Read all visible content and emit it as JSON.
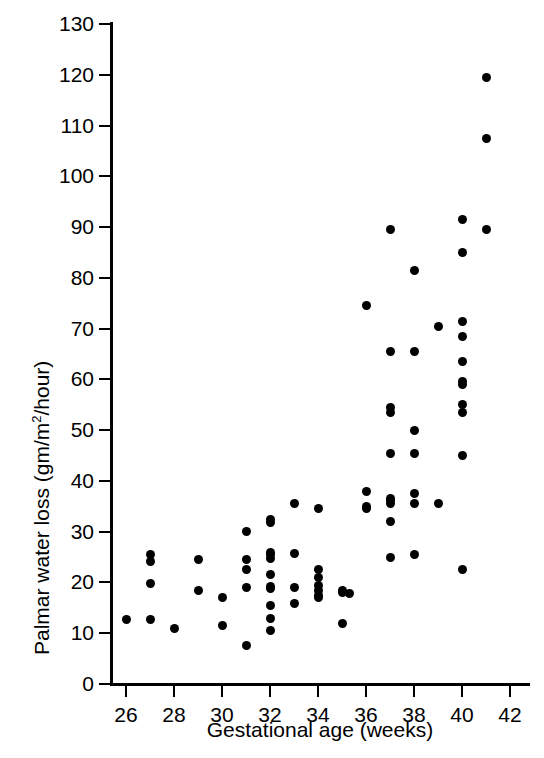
{
  "chart_data": {
    "type": "scatter",
    "title": "",
    "xlabel": "Gestational age (weeks)",
    "ylabel": "Palmar water loss (gm/m2/hour)",
    "ylabel_text": "Palmar water loss (gm/m",
    "ylabel_sup": "2",
    "ylabel_tail": "/hour)",
    "xlim": [
      25,
      42.5
    ],
    "ylim": [
      0,
      130
    ],
    "grid": false,
    "legend": null,
    "marker": "filled-circle",
    "marker_color": "#000000",
    "xticks": [
      26,
      28,
      30,
      32,
      34,
      36,
      38,
      40,
      42
    ],
    "xtick_labels": [
      "26",
      "28",
      "30",
      "32",
      "34",
      "36",
      "38",
      "40",
      "42"
    ],
    "yticks": [
      0,
      10,
      20,
      30,
      40,
      50,
      60,
      70,
      80,
      90,
      100,
      110,
      120,
      130
    ],
    "ytick_labels": [
      "0",
      "10",
      "20",
      "30",
      "40",
      "50",
      "60",
      "70",
      "80",
      "90",
      "100",
      "110",
      "120",
      "130"
    ],
    "x": [
      26,
      27,
      27,
      27,
      27,
      28,
      29,
      29,
      30,
      30,
      31,
      31,
      31,
      31,
      31,
      32,
      32,
      32,
      32,
      32,
      32,
      32,
      32,
      32,
      32,
      32,
      33,
      33,
      33,
      33,
      34,
      34,
      34,
      34,
      34,
      34,
      34,
      35,
      35,
      35,
      35,
      36,
      36,
      36,
      36,
      37,
      37,
      37,
      37,
      37,
      37,
      37,
      37,
      37,
      37,
      38,
      38,
      38,
      38,
      38,
      38,
      38,
      39,
      39,
      40,
      40,
      40,
      40,
      40,
      40,
      40,
      40,
      40,
      40,
      40,
      41,
      41,
      41
    ],
    "y": [
      12.8,
      25.5,
      24.2,
      19.8,
      12.8,
      11.0,
      24.5,
      18.5,
      17.0,
      11.5,
      30.0,
      24.5,
      22.5,
      19.0,
      7.5,
      32.5,
      31.8,
      26.0,
      25.5,
      24.8,
      21.5,
      19.3,
      18.8,
      15.5,
      13.0,
      10.5,
      35.5,
      25.8,
      19.0,
      15.8,
      34.5,
      22.5,
      21.0,
      19.5,
      18.5,
      17.5,
      17.0,
      18.5,
      18.0,
      17.8,
      12.0,
      74.5,
      38.0,
      35.0,
      34.5,
      89.5,
      65.5,
      54.5,
      53.5,
      45.5,
      36.5,
      36.2,
      35.5,
      32.0,
      25.0,
      81.5,
      65.5,
      50.0,
      45.5,
      37.5,
      35.5,
      25.5,
      70.5,
      35.5,
      91.5,
      85.0,
      71.5,
      68.5,
      63.5,
      59.5,
      59.0,
      55.0,
      53.5,
      45.0,
      22.5,
      119.5,
      107.5,
      89.5
    ]
  },
  "axes": {
    "x_title": "Gestational age (weeks)",
    "y_title_main": "Palmar water loss (gm/m",
    "y_title_sup": "2",
    "y_title_end": "/hour)"
  }
}
